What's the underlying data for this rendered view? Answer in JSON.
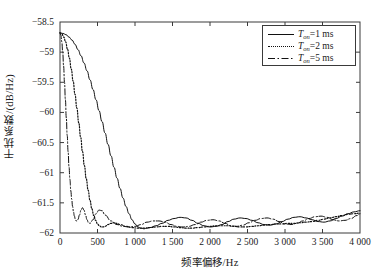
{
  "chart_data": {
    "type": "line",
    "title": "",
    "xlabel": "频率偏移/Hz",
    "ylabel": "干扰系数/(dB/Hz)",
    "xlim": [
      0,
      4000
    ],
    "ylim": [
      -62,
      -58.5
    ],
    "grid": false,
    "legend_position": "top-right",
    "xticks": [
      0,
      500,
      1000,
      1500,
      2000,
      2500,
      3000,
      3500,
      4000
    ],
    "xtick_labels": [
      "0",
      "500",
      "1 000",
      "1 500",
      "2 000",
      "2 500",
      "3 000",
      "3 500",
      "4 000"
    ],
    "yticks": [
      -58.5,
      -59,
      -59.5,
      -60,
      -60.5,
      -61,
      -61.5,
      -62
    ],
    "ytick_labels": [
      "−58.5",
      "−59",
      "−59.5",
      "−60",
      "−60.5",
      "−61",
      "−61.5",
      "−62"
    ],
    "series": [
      {
        "name": "T_on=1 ms",
        "label_var": "T",
        "label_sub": "on",
        "label_value": "=1 ms",
        "style": "solid",
        "color": "#111111",
        "x": [
          0,
          40,
          80,
          120,
          160,
          200,
          240,
          280,
          320,
          360,
          400,
          440,
          480,
          520,
          560,
          600,
          640,
          680,
          720,
          760,
          800,
          840,
          880,
          920,
          960,
          1000,
          1040,
          1080,
          1120,
          1160,
          1200,
          1280,
          1360,
          1440,
          1520,
          1600,
          1680,
          1760,
          1840,
          1920,
          2000,
          2080,
          2160,
          2240,
          2320,
          2400,
          2480,
          2560,
          2640,
          2720,
          2800,
          2880,
          2960,
          3040,
          3120,
          3200,
          3280,
          3360,
          3440,
          3520,
          3600,
          3680,
          3760,
          3840,
          3920,
          4000
        ],
        "y": [
          -58.68,
          -58.69,
          -58.71,
          -58.75,
          -58.8,
          -58.87,
          -58.96,
          -59.06,
          -59.18,
          -59.31,
          -59.46,
          -59.62,
          -59.79,
          -59.97,
          -60.15,
          -60.34,
          -60.53,
          -60.72,
          -60.91,
          -61.09,
          -61.26,
          -61.42,
          -61.56,
          -61.68,
          -61.78,
          -61.85,
          -61.9,
          -61.92,
          -61.93,
          -61.92,
          -61.91,
          -61.88,
          -61.84,
          -61.79,
          -61.76,
          -61.74,
          -61.75,
          -61.79,
          -61.84,
          -61.88,
          -61.9,
          -61.89,
          -61.86,
          -61.81,
          -61.77,
          -61.75,
          -61.76,
          -61.79,
          -61.83,
          -61.86,
          -61.87,
          -61.85,
          -61.81,
          -61.77,
          -61.74,
          -61.73,
          -61.75,
          -61.78,
          -61.81,
          -61.82,
          -61.8,
          -61.76,
          -61.72,
          -61.68,
          -61.65,
          -61.63
        ]
      },
      {
        "name": "T_on=2 ms",
        "label_var": "T",
        "label_sub": "on",
        "label_value": "=2 ms",
        "style": "dotted",
        "color": "#111111",
        "x": [
          0,
          25,
          50,
          75,
          100,
          125,
          150,
          175,
          200,
          225,
          250,
          275,
          300,
          325,
          350,
          375,
          400,
          425,
          450,
          475,
          500,
          525,
          550,
          575,
          600,
          640,
          680,
          720,
          760,
          800,
          880,
          960,
          1040,
          1120,
          1200,
          1280,
          1360,
          1440,
          1520,
          1600,
          1680,
          1760,
          1840,
          1920,
          2000,
          2080,
          2160,
          2240,
          2320,
          2400,
          2480,
          2560,
          2640,
          2720,
          2800,
          2880,
          2960,
          3040,
          3120,
          3200,
          3280,
          3360,
          3440,
          3520,
          3600,
          3680,
          3760,
          3840,
          3920,
          4000
        ],
        "y": [
          -58.68,
          -58.7,
          -58.75,
          -58.83,
          -58.95,
          -59.1,
          -59.28,
          -59.48,
          -59.7,
          -59.93,
          -60.17,
          -60.41,
          -60.65,
          -60.88,
          -61.1,
          -61.29,
          -61.46,
          -61.6,
          -61.71,
          -61.79,
          -61.85,
          -61.88,
          -61.9,
          -61.9,
          -61.89,
          -61.86,
          -61.84,
          -61.83,
          -61.84,
          -61.86,
          -61.89,
          -61.91,
          -61.92,
          -61.92,
          -61.91,
          -61.9,
          -61.89,
          -61.89,
          -61.9,
          -61.91,
          -61.92,
          -61.92,
          -61.91,
          -61.9,
          -61.89,
          -61.88,
          -61.88,
          -61.88,
          -61.89,
          -61.9,
          -61.9,
          -61.89,
          -61.88,
          -61.87,
          -61.86,
          -61.85,
          -61.85,
          -61.84,
          -61.84,
          -61.83,
          -61.82,
          -61.81,
          -61.79,
          -61.77,
          -61.75,
          -61.73,
          -61.71,
          -61.69,
          -61.68,
          -61.67
        ]
      },
      {
        "name": "T_on=5 ms",
        "label_var": "T",
        "label_sub": "on",
        "label_value": "=5 ms",
        "style": "dashdot",
        "color": "#111111",
        "x": [
          0,
          12,
          24,
          36,
          48,
          60,
          72,
          84,
          96,
          108,
          120,
          132,
          144,
          156,
          168,
          180,
          192,
          204,
          216,
          228,
          240,
          260,
          280,
          300,
          320,
          340,
          360,
          380,
          400,
          440,
          480,
          520,
          560,
          600,
          680,
          760,
          840,
          920,
          1000,
          1080,
          1160,
          1240,
          1320,
          1400,
          1480,
          1560,
          1640,
          1720,
          1800,
          1880,
          1960,
          2040,
          2120,
          2200,
          2280,
          2360,
          2440,
          2520,
          2600,
          2680,
          2760,
          2840,
          2920,
          3000,
          3080,
          3160,
          3240,
          3320,
          3400,
          3480,
          3560,
          3640,
          3720,
          3800,
          3880,
          3960,
          4000
        ],
        "y": [
          -58.68,
          -58.72,
          -58.83,
          -59.0,
          -59.23,
          -59.5,
          -59.79,
          -60.09,
          -60.38,
          -60.65,
          -60.9,
          -61.11,
          -61.29,
          -61.44,
          -61.56,
          -61.65,
          -61.72,
          -61.77,
          -61.8,
          -61.8,
          -61.78,
          -61.7,
          -61.62,
          -61.58,
          -61.62,
          -61.7,
          -61.78,
          -61.83,
          -61.84,
          -61.78,
          -61.68,
          -61.62,
          -61.63,
          -61.7,
          -61.8,
          -61.86,
          -61.89,
          -61.9,
          -61.89,
          -61.86,
          -61.82,
          -61.8,
          -61.8,
          -61.82,
          -61.86,
          -61.89,
          -61.9,
          -61.89,
          -61.86,
          -61.82,
          -61.79,
          -61.78,
          -61.8,
          -61.84,
          -61.88,
          -61.89,
          -61.87,
          -61.83,
          -61.79,
          -61.76,
          -61.75,
          -61.77,
          -61.81,
          -61.85,
          -61.86,
          -61.84,
          -61.8,
          -61.76,
          -61.73,
          -61.72,
          -61.74,
          -61.78,
          -61.8,
          -61.79,
          -61.76,
          -61.71,
          -61.68
        ]
      }
    ]
  },
  "axes": {
    "frame_color": "#3a3a3a",
    "background": "#ffffff"
  }
}
